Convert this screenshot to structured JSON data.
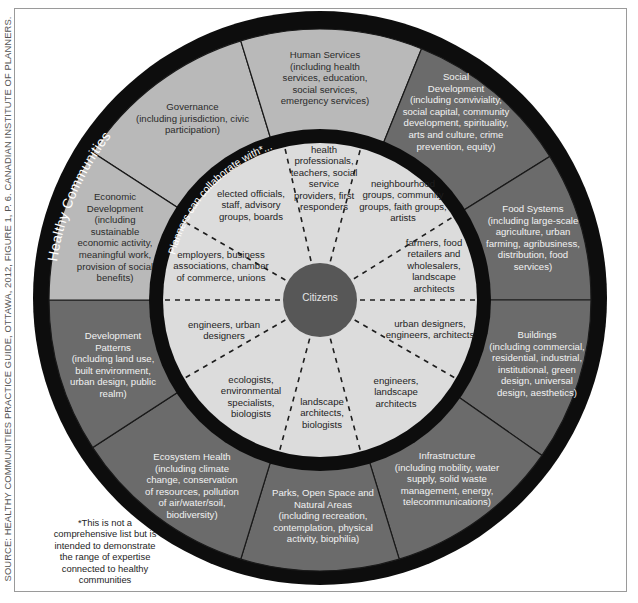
{
  "source_credit": "SOURCE: HEALTHY COMMUNITIES PRACTICE GUIDE, OTTAWA, 2012, FIGURE 1, P. 6. CANADIAN INSTITUTE OF PLANNERS.",
  "outer_ring_title": "Healthy Communities",
  "inner_ring_title": "Planners can collaborate with*...",
  "center_label": "Citizens",
  "colors": {
    "ring_black": "#0d0d0d",
    "light_segment": "#b9b9b9",
    "dark_segment": "#6b6b6b",
    "inner_circle": "#dcdcdc",
    "center_circle": "#575757"
  },
  "outer_segments": [
    {
      "id": "governance",
      "title": "Governance",
      "detail": "(including jurisdiction, civic participation)",
      "shade": "light"
    },
    {
      "id": "human-services",
      "title": "Human Services",
      "detail": "(including health services, education, social services, emergency services)",
      "shade": "light"
    },
    {
      "id": "social-development",
      "title": "Social Development",
      "detail": "(including conviviality, social capital, community development, spirituality, arts and culture, crime prevention, equity)",
      "shade": "dark"
    },
    {
      "id": "food-systems",
      "title": "Food Systems",
      "detail": "(including large-scale agriculture, urban farming, agribusiness, distribution, food services)",
      "shade": "dark"
    },
    {
      "id": "buildings",
      "title": "Buildings",
      "detail": "(including commercial, residential, industrial, institutional, green design, universal design, aesthetics)",
      "shade": "dark"
    },
    {
      "id": "infrastructure",
      "title": "Infrastructure",
      "detail": "(including mobility, water supply, solid waste management, energy, telecommunications)",
      "shade": "dark"
    },
    {
      "id": "parks",
      "title": "Parks, Open Space and Natural Areas",
      "detail": "(including recreation, contemplation, physical activity, biophilia)",
      "shade": "dark"
    },
    {
      "id": "ecosystem-health",
      "title": "Ecosystem Health",
      "detail": "(including climate change, conservation of resources, pollution of air/water/soil, biodiversity)",
      "shade": "dark"
    },
    {
      "id": "development-patterns",
      "title": "Development Patterns",
      "detail": "(including land use, built environment, urban design, public realm)",
      "shade": "dark"
    },
    {
      "id": "economic-development",
      "title": "Economic Development",
      "detail": "(including sustainable economic activity, meaningful work, provision of social benefits)",
      "shade": "light"
    }
  ],
  "inner_segments": [
    {
      "id": "health-professionals",
      "text": "health professionals, teachers, social service providers, first responders"
    },
    {
      "id": "neighbourhood-groups",
      "text": "neighbourhood groups, community groups, faith groups, artists"
    },
    {
      "id": "farmers",
      "text": "farmers, food retailers and wholesalers, landscape architects"
    },
    {
      "id": "urban-designers",
      "text": "urban designers, engineers, architects"
    },
    {
      "id": "engineers-landscape",
      "text": "engineers, landscape architects"
    },
    {
      "id": "landscape-architects",
      "text": "landscape architects, biologists"
    },
    {
      "id": "ecologists",
      "text": "ecologists, environmental specialists, biologists"
    },
    {
      "id": "engineers-urban",
      "text": "engineers, urban designers"
    },
    {
      "id": "employers",
      "text": "employers, business associations, chamber of commerce, unions"
    },
    {
      "id": "elected-officials",
      "text": "elected officials, staff, advisory groups, boards"
    }
  ],
  "footnote": "*This is not a comprehensive list but is intended to demonstrate the range of expertise connected to healthy communities"
}
